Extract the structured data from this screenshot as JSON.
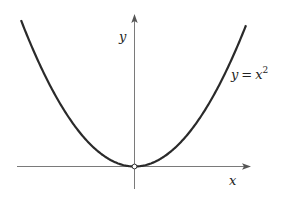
{
  "chart_data": {
    "type": "line",
    "title": "",
    "function": "y = x^2",
    "xlabel": "x",
    "ylabel": "y",
    "series": [
      {
        "name": "y = x^2",
        "x": [
          -3,
          -2.5,
          -2,
          -1.5,
          -1,
          -0.5,
          0,
          0.5,
          1,
          1.5,
          2,
          2.5,
          3
        ],
        "values": [
          9,
          6.25,
          4,
          2.25,
          1,
          0.25,
          0,
          0.25,
          1,
          2.25,
          4,
          6.25,
          9
        ]
      }
    ],
    "annotations": [
      {
        "text": "y = x^2",
        "position": "right branch, upper"
      },
      {
        "text": "open circle",
        "position": "origin (0,0)"
      }
    ],
    "grid": false,
    "ticks": false,
    "legend": "none"
  },
  "labels": {
    "y_axis": "y",
    "x_axis": "x",
    "curve_lhs": "y",
    "curve_op": "=",
    "curve_rhs": "x",
    "curve_exp": "2"
  },
  "colors": {
    "curve": "#2a2a2a",
    "axis": "#7a7a7a",
    "background": "#ffffff"
  },
  "geometry": {
    "origin_px": [
      134,
      166
    ],
    "scale_a": 0.01136,
    "x_left_px": 21,
    "x_right_px": 246
  }
}
